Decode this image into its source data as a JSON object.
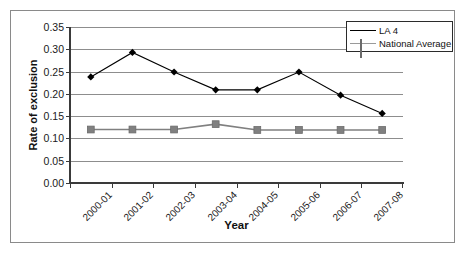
{
  "chart_data": {
    "type": "line",
    "title": "",
    "xlabel": "Year",
    "ylabel": "Rate of exclusion",
    "categories": [
      "2000-01",
      "2001-02",
      "2002-03",
      "2003-04",
      "2004-05",
      "2005-06",
      "2006-07",
      "2007-08"
    ],
    "series": [
      {
        "name": "LA 4",
        "color": "#000000",
        "marker": "diamond",
        "values": [
          0.238,
          0.293,
          0.249,
          0.209,
          0.209,
          0.249,
          0.197,
          0.156
        ]
      },
      {
        "name": "National Average",
        "color": "#808080",
        "marker": "square",
        "values": [
          0.12,
          0.12,
          0.12,
          0.132,
          0.119,
          0.119,
          0.119,
          0.119
        ]
      }
    ],
    "ylim": [
      0.0,
      0.35
    ],
    "yticks": [
      "0.00",
      "0.05",
      "0.10",
      "0.15",
      "0.20",
      "0.25",
      "0.30",
      "0.35"
    ],
    "ytick_values": [
      0.0,
      0.05,
      0.1,
      0.15,
      0.2,
      0.25,
      0.3,
      0.35
    ],
    "grid": true,
    "legend_position": "top-right"
  },
  "legend": {
    "items": [
      {
        "label": "LA 4"
      },
      {
        "label": "National Average"
      }
    ]
  },
  "colors": {
    "series_1": "#000000",
    "series_2": "#808080",
    "gridline": "#8d8d8d",
    "axis": "#3a3a3a",
    "frame": "#8a8a8a"
  }
}
